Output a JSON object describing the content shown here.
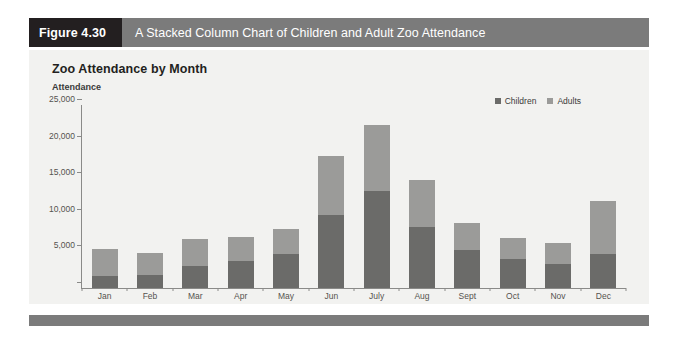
{
  "figure": {
    "tag": "Figure 4.30",
    "caption": "A Stacked Column Chart of Children and Adult Zoo Attendance"
  },
  "colors": {
    "tag_bg": "#231f20",
    "caption_bg": "#7b7b7b",
    "panel_bg": "#f2f2f0",
    "children": "#6b6b69",
    "adults": "#9b9b99",
    "axis": "#8a8a88",
    "band": "#7b7b7b"
  },
  "chart_data": {
    "type": "bar",
    "stacked": true,
    "title": "Zoo Attendance by Month",
    "subtitle": "Attendance",
    "xlabel": "",
    "ylabel": "Attendance",
    "ylim": [
      0,
      25000
    ],
    "ytick_values": [
      0,
      5000,
      10000,
      15000,
      20000,
      25000
    ],
    "ytick_labels": [
      "",
      "5,000",
      "10,000",
      "15,000",
      "20,000",
      "25,000"
    ],
    "grid": false,
    "legend_position": "top-right",
    "categories": [
      "Jan",
      "Feb",
      "Mar",
      "Apr",
      "May",
      "Jun",
      "July",
      "Aug",
      "Sept",
      "Oct",
      "Nov",
      "Dec"
    ],
    "series": [
      {
        "name": "Children",
        "color": "#6b6b69",
        "values": [
          1700,
          1800,
          3000,
          3700,
          4600,
          10000,
          13300,
          8300,
          5200,
          4000,
          3300,
          4600
        ]
      },
      {
        "name": "Adults",
        "color": "#9b9b99",
        "values": [
          3600,
          3000,
          3700,
          3300,
          3500,
          8000,
          9000,
          6500,
          3700,
          2800,
          2800,
          7300
        ]
      }
    ],
    "totals": [
      5300,
      4800,
      6700,
      7000,
      8100,
      18000,
      22300,
      14800,
      8900,
      6800,
      6100,
      11900
    ]
  }
}
